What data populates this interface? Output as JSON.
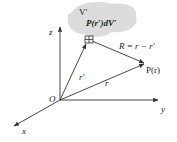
{
  "diagram": {
    "volume_label": "V′",
    "element_label": "P(r′)dV′",
    "separation_label": "R = r − r′",
    "field_point_label": "P(r)",
    "source_vector_label": "r′",
    "field_vector_label": "r",
    "origin_label": "O",
    "axes": {
      "x": "x",
      "y": "y",
      "z": "z"
    },
    "colors": {
      "volume_fill": "#dcdcdc",
      "line": "#333333",
      "text": "#222222"
    }
  }
}
